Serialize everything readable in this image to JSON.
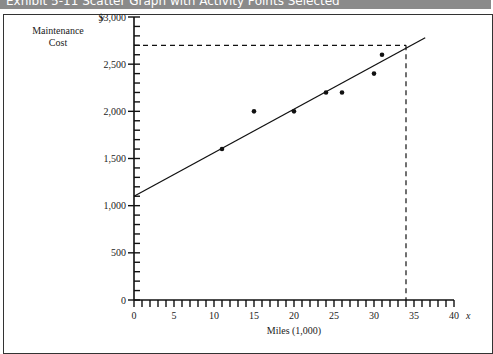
{
  "header": {
    "title": "Exhibit 5-11   Scatter Graph with Activity Points Selected"
  },
  "chart_data": {
    "type": "scatter",
    "title": "Scatter Graph with Activity Points Selected",
    "xlabel": "Miles (1,000)",
    "ylabel": "Maintenance Cost",
    "x_axis_var": "x",
    "y_axis_var": "y",
    "xlim": [
      0,
      40
    ],
    "ylim": [
      0,
      3000
    ],
    "x_ticks": [
      0,
      5,
      10,
      15,
      20,
      25,
      30,
      35,
      40
    ],
    "y_ticks": [
      0,
      500,
      1000,
      1500,
      2000,
      2500,
      3000
    ],
    "y_tick_labels": [
      "0",
      "500",
      "1,000",
      "1,500",
      "2,000",
      "2,500",
      "$3,000"
    ],
    "points": [
      {
        "x": 11,
        "y": 1600
      },
      {
        "x": 15,
        "y": 2000
      },
      {
        "x": 20,
        "y": 2000
      },
      {
        "x": 24,
        "y": 2200
      },
      {
        "x": 26,
        "y": 2200
      },
      {
        "x": 30,
        "y": 2400
      },
      {
        "x": 31,
        "y": 2600
      }
    ],
    "fit_line": {
      "x0": 0,
      "y0": 1100,
      "x1": 36.4,
      "y1": 2780
    },
    "reference": {
      "x": 34,
      "y": 2700
    },
    "grid": false,
    "legend": null
  },
  "labels": {
    "y_var": "y",
    "y_title_1": "Maintenance",
    "y_title_2": "Cost",
    "x_var": "x",
    "x_title": "Miles (1,000)"
  }
}
